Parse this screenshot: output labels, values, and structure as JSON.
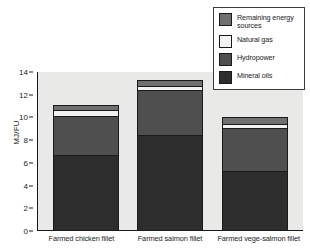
{
  "chart_data": {
    "type": "bar",
    "subtype": "stacked-bar",
    "title": "",
    "xlabel": "",
    "ylabel": "MJ/FU",
    "ylim": [
      0,
      14
    ],
    "yticks": [
      0,
      2,
      4,
      6,
      8,
      10,
      12,
      14
    ],
    "ytick_labels": [
      "0",
      "2",
      "4",
      "6",
      "8",
      "10",
      "12",
      "14"
    ],
    "grid": false,
    "legend_position": "top-right",
    "categories": [
      "Farmed chicken fillet",
      "Farmed salmon fillet",
      "Farmed vege-salmon fillet"
    ],
    "series": [
      {
        "name": "Mineral oils",
        "color": "#2d2d2d",
        "values": [
          6.6,
          8.4,
          5.2
        ]
      },
      {
        "name": "Hydropower",
        "color": "#4f4f4f",
        "values": [
          3.4,
          3.9,
          3.8
        ]
      },
      {
        "name": "Natural gas",
        "color": "#f2f2f0",
        "values": [
          0.6,
          0.4,
          0.3
        ]
      },
      {
        "name": "Remaining energy sources",
        "color": "#707070",
        "values": [
          0.3,
          0.45,
          0.55
        ]
      }
    ],
    "totals": [
      10.9,
      13.15,
      9.85
    ]
  },
  "legend": {
    "items": [
      {
        "label": "Remaining energy sources",
        "color": "#707070"
      },
      {
        "label": "Natural gas",
        "color": "#f2f2f0"
      },
      {
        "label": "Hydropower",
        "color": "#4f4f4f"
      },
      {
        "label": "Mineral oils",
        "color": "#2d2d2d"
      }
    ]
  },
  "axis": {
    "y_title": "MJ/FU"
  },
  "colors": {
    "plot_background": "#e9e9e7",
    "page_background": "#ffffff",
    "axis": "#1a1a1a",
    "legend_border": "#3a3a3a"
  }
}
